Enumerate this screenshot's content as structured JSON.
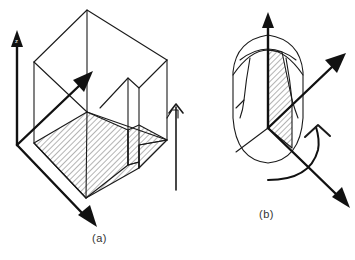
{
  "figure": {
    "panels": [
      {
        "id": "a",
        "caption": "(a)",
        "description": "Isometric rectangular block with stepped notch, hatched base section, three coordinate axes and an upward arrow",
        "axis_label_z": "z"
      },
      {
        "id": "b",
        "caption": "(b)",
        "description": "Rounded capsule-shaped solid with hatched sector, three coordinate axes and a curved rotation arrow"
      }
    ],
    "colors": {
      "line": "#1a1a1a",
      "background": "#ffffff"
    }
  }
}
